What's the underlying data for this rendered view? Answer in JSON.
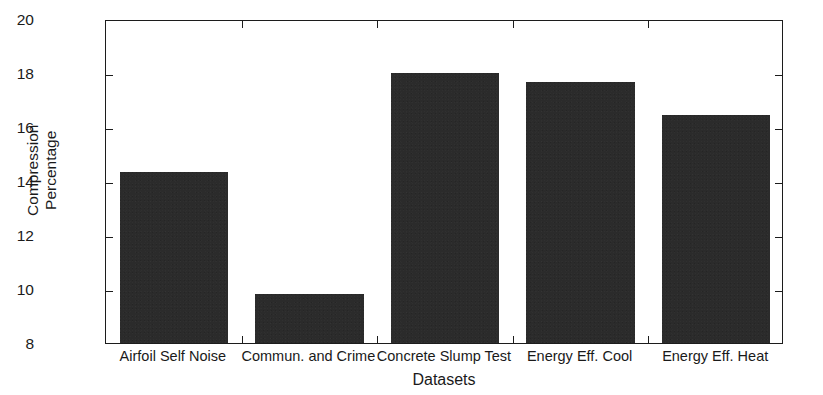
{
  "chart_data": {
    "type": "bar",
    "title": "",
    "subtitle": "",
    "xlabel": "Datasets",
    "ylabel": "Compression Percentage",
    "ylabel_lines": [
      "Compression",
      "Percentage"
    ],
    "categories": [
      "Airfoil Self Noise",
      "Commun. and Crime",
      "Concrete Slump Test",
      "Energy Eff. Cool",
      "Energy Eff. Heat"
    ],
    "values": [
      14.35,
      9.8,
      18.0,
      17.67,
      16.45
    ],
    "ylim": [
      8,
      20
    ],
    "xlim": [
      0,
      5
    ],
    "yticks": [
      8,
      10,
      12,
      14,
      16,
      18,
      20
    ],
    "ytick_labels": [
      "8",
      "10",
      "12",
      "14",
      "16",
      "18",
      "20"
    ],
    "grid": false,
    "legend": null,
    "legend_position": "none",
    "bar_color": "#2b2b2b",
    "axis_color": "#1c1c1c",
    "background": "#ffffff",
    "bar_width_fraction": 0.8,
    "annotations": []
  }
}
